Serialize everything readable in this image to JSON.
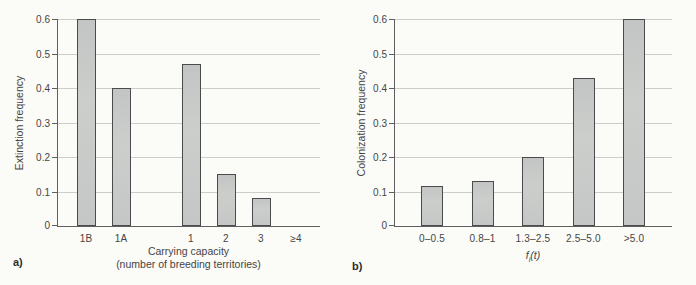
{
  "figure": {
    "background": "#fbfbf8"
  },
  "colors": {
    "bar_fill": "#c7cac7",
    "bar_border": "#4a4b4c",
    "grid": "#cdcdca",
    "axis": "#5f5f5f",
    "text": "#454545"
  },
  "chart_data": [
    {
      "type": "bar",
      "panel_label": "a)",
      "title": "",
      "ylabel": "Extinction frequency",
      "xlabel_line1": "Carrying capacity",
      "xlabel_line2": "(number of breeding territories)",
      "categories": [
        "1B",
        "1A",
        "",
        "1",
        "2",
        "3",
        "≥4"
      ],
      "values": [
        0.6,
        0.4,
        null,
        0.47,
        0.15,
        0.08,
        0
      ],
      "ylim": [
        0,
        0.6
      ],
      "yticks": [
        0,
        0.1,
        0.2,
        0.3,
        0.4,
        0.5,
        0.6
      ],
      "ytick_labels": [
        "0",
        "0.1",
        "0.2",
        "0.3",
        "0.4",
        "0.5",
        "0.6"
      ],
      "grid": true,
      "legend": null
    },
    {
      "type": "bar",
      "panel_label": "b)",
      "title": "",
      "ylabel": "Colonization frequency",
      "xlabel": "fi(t)",
      "xlabel_parts": {
        "base": "f",
        "sub": "i",
        "suffix": "(t)"
      },
      "categories": [
        "0–0.5",
        "0.8–1",
        "1.3–2.5",
        "2.5–5.0",
        ">5.0"
      ],
      "values": [
        0.115,
        0.13,
        0.2,
        0.43,
        0.6
      ],
      "ylim": [
        0,
        0.6
      ],
      "yticks": [
        0,
        0.1,
        0.2,
        0.3,
        0.4,
        0.5,
        0.6
      ],
      "ytick_labels": [
        "0",
        "0.1",
        "0.2",
        "0.3",
        "0.4",
        "0.5",
        "0.6"
      ],
      "grid": true,
      "legend": null
    }
  ]
}
